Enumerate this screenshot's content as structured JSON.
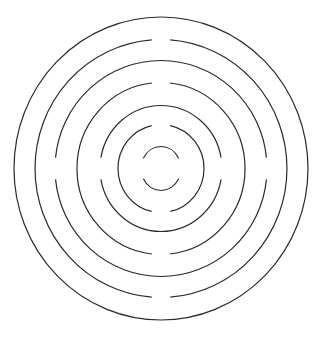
{
  "figure": {
    "width": 324,
    "height": 343,
    "background": "#ffffff",
    "stroke_color": "#2a2a2a",
    "center": [
      161,
      168.5
    ],
    "rings": [
      {
        "name": "ring-1-outer",
        "rx": 147,
        "ry": 151.5,
        "gaps": []
      },
      {
        "name": "ring-2",
        "rx": 126,
        "ry": 129,
        "gaps": [
          "top",
          "bottom"
        ],
        "gap_half_angle_deg": 4.2
      },
      {
        "name": "ring-3",
        "rx": 106,
        "ry": 108,
        "gaps": [
          "left",
          "right"
        ],
        "gap_half_angle_deg": 5.8
      },
      {
        "name": "ring-4",
        "rx": 84,
        "ry": 86,
        "gaps": [
          "top",
          "bottom"
        ],
        "gap_half_angle_deg": 6.2
      },
      {
        "name": "ring-5",
        "rx": 61,
        "ry": 63,
        "gaps": [
          "left",
          "right"
        ],
        "gap_half_angle_deg": 10
      },
      {
        "name": "ring-6",
        "rx": 43,
        "ry": 44,
        "gaps": [
          "top",
          "bottom"
        ],
        "gap_half_angle_deg": 12.5
      },
      {
        "name": "ring-7-inner",
        "rx": 20,
        "ry": 22,
        "gaps": [
          "left",
          "right"
        ],
        "gap_half_angle_deg": 28
      }
    ]
  }
}
